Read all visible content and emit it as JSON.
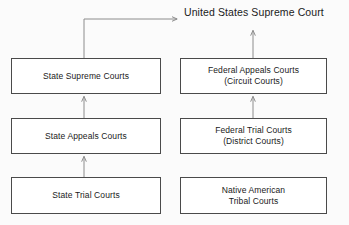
{
  "diagram": {
    "apex": {
      "label": "United States Supreme Court"
    },
    "columns": {
      "state": "State Courts",
      "federal": "Federal Courts"
    },
    "nodes": [
      {
        "id": "state-supreme-courts",
        "line1": "State Supreme Courts",
        "line2": "",
        "column": "state",
        "level": 3
      },
      {
        "id": "state-appeals-courts",
        "line1": "State Appeals Courts",
        "line2": "",
        "column": "state",
        "level": 2
      },
      {
        "id": "state-trial-courts",
        "line1": "State Trial Courts",
        "line2": "",
        "column": "state",
        "level": 1
      },
      {
        "id": "federal-appeals-courts",
        "line1": "Federal Appeals Courts",
        "line2": "(Circuit Courts)",
        "column": "federal",
        "level": 3
      },
      {
        "id": "federal-trial-courts",
        "line1": "Federal Trial Courts",
        "line2": "(District Courts)",
        "column": "federal",
        "level": 2
      },
      {
        "id": "native-american-tribal-courts",
        "line1": "Native American",
        "line2": "Tribal Courts",
        "column": "federal",
        "level": 1
      }
    ],
    "edges": [
      {
        "id": "state-trial-to-state-appeals",
        "from": "state-trial-courts",
        "to": "state-appeals-courts",
        "style": "arrow-up"
      },
      {
        "id": "state-appeals-to-state-supreme",
        "from": "state-appeals-courts",
        "to": "state-supreme-courts",
        "style": "arrow-up"
      },
      {
        "id": "state-supreme-to-us-supreme",
        "from": "state-supreme-courts",
        "to": "apex",
        "style": "elbow-arrow-right"
      },
      {
        "id": "federal-trial-to-federal-appeals",
        "from": "federal-trial-courts",
        "to": "federal-appeals-courts",
        "style": "arrow-up"
      },
      {
        "id": "federal-appeals-to-us-supreme",
        "from": "federal-appeals-courts",
        "to": "apex",
        "style": "arrow-up"
      }
    ],
    "colors": {
      "background": "#fbfbfb",
      "node_fill": "#ffffff",
      "node_border": "#4a4a4a",
      "edge": "#8c8c8c",
      "text": "#1a1a1a"
    }
  }
}
